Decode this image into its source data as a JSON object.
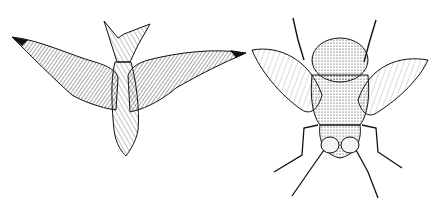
{
  "illustration": {
    "style": "pen-and-ink sketch",
    "background": "#ffffff",
    "ink": "#111111",
    "subjects": [
      {
        "name": "bird",
        "view": "underside, wings spread, forked tail up"
      },
      {
        "name": "fly",
        "view": "dorsal, wings spread, head down, legs splayed"
      }
    ]
  }
}
